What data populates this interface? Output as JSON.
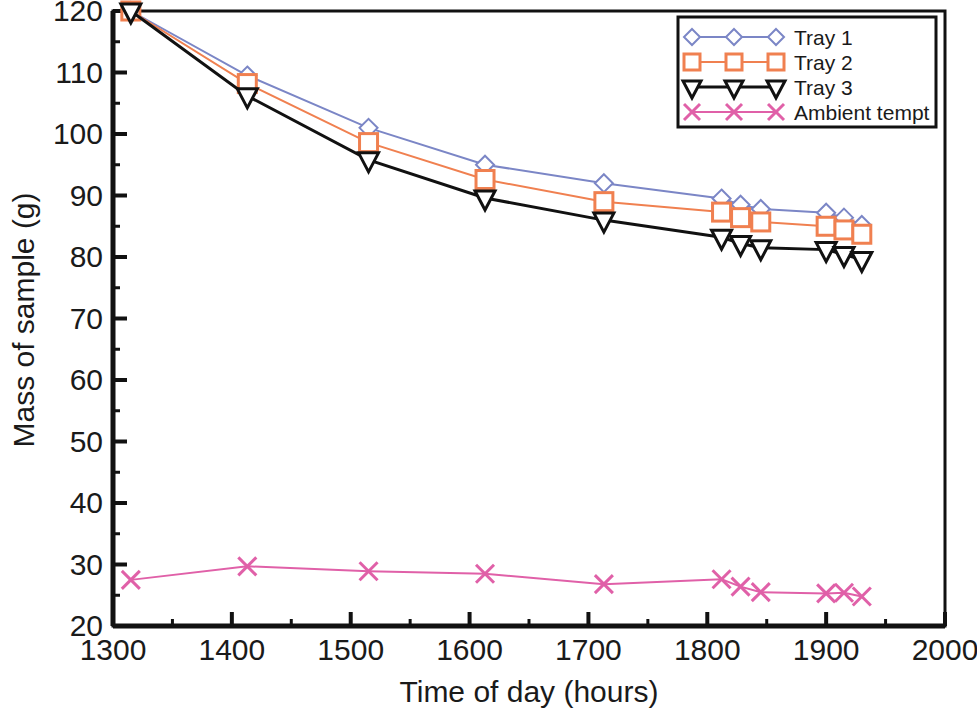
{
  "chart_data": {
    "type": "line",
    "title": "",
    "xlabel": "Time of day (hours)",
    "ylabel": "Mass of sample (g)",
    "xlim": [
      1300,
      2000
    ],
    "ylim": [
      20,
      120
    ],
    "xticks": [
      1300,
      1400,
      1500,
      1600,
      1700,
      1800,
      1900,
      2000
    ],
    "xtick_labels": [
      "1300",
      "1400",
      "1500",
      "1600",
      "1700",
      "1800",
      "1900",
      "2000"
    ],
    "yticks": [
      20,
      30,
      40,
      50,
      60,
      70,
      80,
      90,
      100,
      110,
      120
    ],
    "ytick_labels": [
      "20",
      "30",
      "40",
      "50",
      "60",
      "70",
      "80",
      "90",
      "100",
      "110",
      "120"
    ],
    "x_minor_tick_step": 50,
    "y_minor_tick_step": 5,
    "grid": false,
    "legend_position": "top-right",
    "series": [
      {
        "name": "Tray 1",
        "color": "#7b86c6",
        "marker": "diamond",
        "x": [
          1315,
          1413,
          1515,
          1613,
          1713,
          1812,
          1828,
          1845,
          1900,
          1915,
          1930
        ],
        "y": [
          120.0,
          109.5,
          101.0,
          95.0,
          92.0,
          89.5,
          88.5,
          87.8,
          87.2,
          86.4,
          85.2
        ]
      },
      {
        "name": "Tray 2",
        "color": "#f08050",
        "marker": "square",
        "x": [
          1315,
          1413,
          1515,
          1613,
          1713,
          1812,
          1828,
          1845,
          1900,
          1915,
          1930
        ],
        "y": [
          120.0,
          108.2,
          98.6,
          92.6,
          89.0,
          87.3,
          86.4,
          85.7,
          85.0,
          84.4,
          83.7
        ]
      },
      {
        "name": "Tray 3",
        "color": "#111111",
        "marker": "triangle-down",
        "x": [
          1315,
          1413,
          1515,
          1613,
          1713,
          1812,
          1828,
          1845,
          1900,
          1915,
          1930
        ],
        "y": [
          120.0,
          106.2,
          95.8,
          89.6,
          86.0,
          83.2,
          82.2,
          81.5,
          81.2,
          80.4,
          79.6
        ]
      },
      {
        "name": "Ambient tempt",
        "color": "#e060a8",
        "marker": "cross",
        "x": [
          1315,
          1413,
          1515,
          1613,
          1713,
          1812,
          1828,
          1845,
          1900,
          1915,
          1930
        ],
        "y": [
          27.5,
          29.7,
          28.9,
          28.5,
          26.8,
          27.6,
          26.4,
          25.5,
          25.3,
          25.4,
          24.8
        ]
      }
    ]
  },
  "legend": {
    "items": [
      {
        "label": "Tray 1"
      },
      {
        "label": "Tray 2"
      },
      {
        "label": "Tray 3"
      },
      {
        "label": "Ambient tempt"
      }
    ]
  },
  "axes": {
    "x_title": "Time of day (hours)",
    "y_title": "Mass of sample (g)"
  }
}
